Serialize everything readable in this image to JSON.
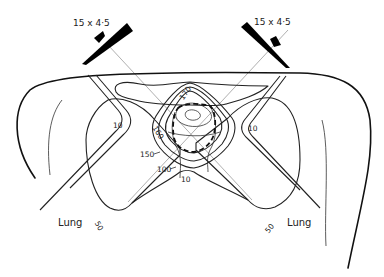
{
  "figure": {
    "type": "radiotherapy isodose distribution",
    "beams": [
      {
        "side": "left",
        "field_label": "15 x 4·5"
      },
      {
        "side": "right",
        "field_label": "15 x 4·5"
      }
    ],
    "isodose_labels": {
      "c170": "170",
      "c160": "160",
      "c150": "150",
      "c100": "100",
      "c10_left": "10",
      "c10_right": "10",
      "c10_bottom": "10",
      "c50_left": "50",
      "c50_right": "50"
    },
    "organ_labels": {
      "lung_left": "Lung",
      "lung_right": "Lung"
    }
  }
}
